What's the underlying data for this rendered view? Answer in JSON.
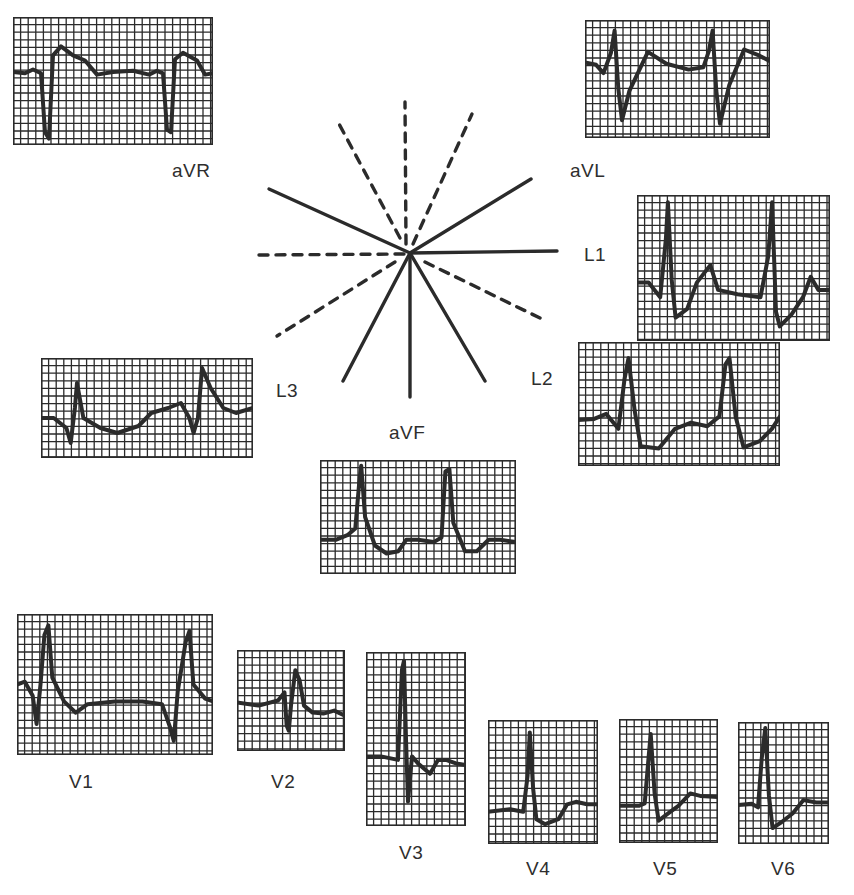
{
  "figure": {
    "colors": {
      "trace": "#2b2b2b",
      "grid": "#2b2b2b",
      "paper": "#ffffff",
      "label": "#2e2e2e"
    }
  },
  "hexaxial": {
    "center": [
      410,
      253
    ],
    "solid_axes": [
      {
        "lead": "L1",
        "angle_deg": 0,
        "end": [
          557,
          251
        ]
      },
      {
        "lead": "aVL",
        "angle_deg": -30,
        "end": [
          531,
          179
        ]
      },
      {
        "lead": "aVR",
        "angle_deg": -150,
        "end": [
          269,
          189
        ]
      },
      {
        "lead": "L2",
        "angle_deg": 60,
        "end": [
          485,
          381
        ]
      },
      {
        "lead": "aVF",
        "angle_deg": 90,
        "end": [
          410,
          397
        ]
      },
      {
        "lead": "L3",
        "angle_deg": 120,
        "end": [
          343,
          381
        ]
      }
    ],
    "dashed_axes": [
      {
        "angle_deg": 180,
        "end": [
          257,
          255
        ]
      },
      {
        "angle_deg": -90,
        "end": [
          405,
          102
        ]
      },
      {
        "angle_deg": -60,
        "end": [
          472,
          114
        ]
      },
      {
        "angle_deg": -120,
        "end": [
          338,
          122
        ]
      },
      {
        "angle_deg": 30,
        "end": [
          540,
          318
        ]
      },
      {
        "angle_deg": 150,
        "end": [
          277,
          336
        ]
      }
    ]
  },
  "leads": [
    {
      "id": "aVR",
      "label": "aVR",
      "strip": [
        13,
        17,
        200,
        128
      ],
      "label_pos": [
        172,
        172
      ]
    },
    {
      "id": "aVL",
      "label": "aVL",
      "strip": [
        585,
        20,
        185,
        118
      ],
      "label_pos": [
        570,
        160
      ]
    },
    {
      "id": "L1",
      "label": "L1",
      "strip": [
        637,
        195,
        193,
        146
      ],
      "label_pos": [
        584,
        243
      ]
    },
    {
      "id": "L2",
      "label": "L2",
      "strip": [
        578,
        342,
        202,
        124
      ],
      "label_pos": [
        531,
        366
      ]
    },
    {
      "id": "L3",
      "label": "L3",
      "strip": [
        41,
        358,
        212,
        100
      ],
      "label_pos": [
        276,
        379
      ]
    },
    {
      "id": "aVF",
      "label": "aVF",
      "strip": [
        320,
        460,
        196,
        114
      ],
      "label_pos": [
        389,
        422
      ]
    },
    {
      "id": "V1",
      "label": "V1",
      "strip": [
        17,
        614,
        196,
        141
      ],
      "label_pos": [
        69,
        771
      ]
    },
    {
      "id": "V2",
      "label": "V2",
      "strip": [
        237,
        650,
        108,
        101
      ],
      "label_pos": [
        271,
        771
      ]
    },
    {
      "id": "V3",
      "label": "V3",
      "strip": [
        366,
        652,
        100,
        174
      ],
      "label_pos": [
        399,
        842
      ]
    },
    {
      "id": "V4",
      "label": "V4",
      "strip": [
        488,
        720,
        110,
        124
      ],
      "label_pos": [
        526,
        858
      ]
    },
    {
      "id": "V5",
      "label": "V5",
      "strip": [
        619,
        719,
        99,
        124
      ],
      "label_pos": [
        653,
        858
      ]
    },
    {
      "id": "V6",
      "label": "V6",
      "strip": [
        738,
        722,
        91,
        122
      ],
      "label_pos": [
        771,
        858
      ]
    }
  ]
}
